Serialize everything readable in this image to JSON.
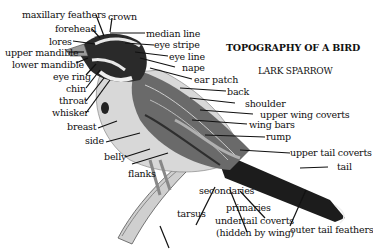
{
  "title": "TOPOGRAPHY OF A BIRD",
  "subtitle": "LARK SPARROW",
  "labels": {
    "maxillary_feathers": "maxillary feathers",
    "crown": "crown",
    "forehead": "forehead",
    "median_line": "median line",
    "lores": "lores",
    "eye_stripe": "eye stripe",
    "upper_mandible": "upper mandible",
    "eye_line": "eye line",
    "lower_mandible": "lower mandible",
    "nape": "nape",
    "eye_ring": "eye ring",
    "ear_patch": "ear patch",
    "chin": "chin",
    "back": "back",
    "throat": "throat",
    "shoulder": "shoulder",
    "whisker": "whisker",
    "upper_wing_coverts": "upper wing coverts",
    "breast": "breast",
    "wing_bars": "wing bars",
    "rump": "rump",
    "side": "side",
    "upper_tail_coverts": "upper tail coverts",
    "belly": "belly",
    "tail": "tail",
    "flanks": "flanks",
    "secondaries": "secondaries",
    "primaries": "primaries",
    "tarsus": "tarsus",
    "undertail_coverts": "undertail coverts",
    "hidden_by_wing": "(hidden by wing)",
    "outer_tail_feathers": "outer tail feathers"
  },
  "colors": {
    "ink": "#111111",
    "bird_light": "#d8d8d8",
    "bird_mid": "#8a8a8a",
    "bird_dark": "#2a2a2a"
  }
}
